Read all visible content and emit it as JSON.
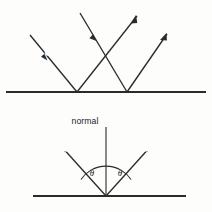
{
  "figure": {
    "background_color": "#fdfdfc",
    "ink_color": "#2b2b2b",
    "panels": [
      {
        "name": "parallel-beam-panel",
        "labels": {
          "incident": "incident",
          "reflected": "reflected"
        },
        "surface": {
          "y": 92,
          "x1": 6,
          "x2": 206
        },
        "rays": [
          {
            "name": "incident-ray-1",
            "x1": 30,
            "y1": 35,
            "x2": 77,
            "y2": 92,
            "arrow_at": [
              47.5,
              60.5
            ]
          },
          {
            "name": "incident-ray-2",
            "x1": 80,
            "y1": 13,
            "x2": 127,
            "y2": 92,
            "arrow_at": [
              96,
              40
            ]
          },
          {
            "name": "reflected-ray-1",
            "x1": 77,
            "y1": 92,
            "x2": 137,
            "y2": 16
          },
          {
            "name": "reflected-ray-2",
            "x1": 127,
            "y1": 92,
            "x2": 167,
            "y2": 34
          }
        ]
      },
      {
        "name": "single-ray-angle-panel",
        "labels": {
          "normal": "normal",
          "incident": "incident",
          "reflected": "reflected",
          "angle_incidence": "θ",
          "angle_reflection": "θ"
        },
        "surface": {
          "y": 196,
          "x1": 33,
          "x2": 186
        },
        "normal": {
          "x": 106,
          "y_top": 127,
          "y_bottom": 196
        },
        "rays": [
          {
            "name": "incident-ray",
            "x1": 106,
            "y1": 196,
            "x2": 60,
            "y2": 145,
            "arrow_at": [
              62,
              147
            ]
          },
          {
            "name": "reflected-ray",
            "x1": 106,
            "y1": 196,
            "x2": 152,
            "y2": 145,
            "arrow_at": [
              150,
              147
            ]
          }
        ],
        "arc": {
          "center_x": 106,
          "center_y": 196,
          "radius": 30
        }
      }
    ]
  }
}
